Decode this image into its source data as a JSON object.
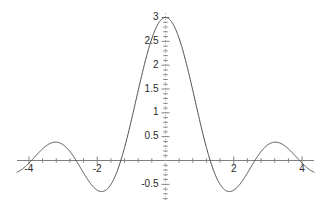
{
  "figure": {
    "type": "function-plot",
    "background_color": "#ffffff",
    "curve_color": "#4a4a4a",
    "axis_color": "#808080",
    "tick_color": "#808080",
    "label_color": "#2a2a2a",
    "width": 322,
    "height": 208
  },
  "axes": {
    "x_axis_name": "horizontal-axis",
    "y_axis_name": "vertical-axis",
    "x_axis_style": "solid",
    "y_axis_style": "dotted",
    "x_tick_labels": [
      "-4",
      "-2",
      "2",
      "4"
    ],
    "x_tick_values": [
      -4,
      -2,
      2,
      4
    ],
    "y_tick_labels": [
      "3",
      "2.5",
      "2",
      "1.5",
      "1",
      "0.5",
      "-0.5"
    ],
    "y_tick_values": [
      3,
      2.5,
      2,
      1.5,
      1,
      0.5,
      -0.5
    ],
    "minor_tick_step_x": 0.4,
    "minor_tick_step_y": 0.1,
    "xlim": [
      -4.35,
      4.35
    ],
    "ylim": [
      -0.85,
      3.15
    ],
    "grid": false,
    "title": "",
    "xlabel": "",
    "ylabel": "",
    "legend": "none"
  },
  "chart_data": {
    "type": "line",
    "title": "",
    "xlabel": "",
    "ylabel": "",
    "xlim": [
      -4.35,
      4.35
    ],
    "ylim": [
      -0.85,
      3.15
    ],
    "grid": false,
    "legend_position": "none",
    "xticks": [
      -4,
      -2,
      2,
      4
    ],
    "xticklabels": [
      "-4",
      "-2",
      "2",
      "4"
    ],
    "yticks": [
      3,
      2.5,
      2,
      1.5,
      1,
      0.5,
      -0.5
    ],
    "yticklabels": [
      "3",
      "2.5",
      "2",
      "1.5",
      "1",
      "0.5",
      "-0.5"
    ],
    "series": [
      {
        "name": "curve",
        "color": "#4a4a4a",
        "expression": "3*sin(2.4*x)/(2.4*x)",
        "peak_value": 3,
        "peak_x": 0,
        "zeros": [
          -3.927,
          -2.618,
          -1.309,
          1.309,
          2.618,
          3.927
        ],
        "local_extrema": [
          {
            "x": -3.27,
            "y": -0.27
          },
          {
            "x": -2.03,
            "y": 0.42
          },
          {
            "x": -1.0,
            "y": -0.64
          },
          {
            "x": 0.0,
            "y": 3.0
          },
          {
            "x": 1.0,
            "y": -0.64
          },
          {
            "x": 2.03,
            "y": 0.42
          },
          {
            "x": 3.27,
            "y": -0.27
          }
        ],
        "x": [
          -4.35,
          -4.2,
          -4.05,
          -3.9,
          -3.75,
          -3.6,
          -3.45,
          -3.3,
          -3.15,
          -3.0,
          -2.85,
          -2.7,
          -2.55,
          -2.4,
          -2.25,
          -2.1,
          -1.95,
          -1.8,
          -1.65,
          -1.5,
          -1.35,
          -1.2,
          -1.05,
          -0.9,
          -0.75,
          -0.6,
          -0.45,
          -0.3,
          -0.15,
          0.0,
          0.15,
          0.3,
          0.45,
          0.6,
          0.75,
          0.9,
          1.05,
          1.2,
          1.35,
          1.5,
          1.65,
          1.8,
          1.95,
          2.1,
          2.25,
          2.4,
          2.55,
          2.7,
          2.85,
          3.0,
          3.15,
          3.3,
          3.45,
          3.6,
          3.75,
          3.9,
          4.05,
          4.2,
          4.35
        ],
        "y": [
          -0.2,
          -0.26,
          -0.29,
          -0.28,
          -0.23,
          -0.15,
          -0.05,
          0.06,
          0.16,
          0.25,
          0.32,
          0.37,
          0.41,
          0.42,
          0.4,
          0.34,
          0.24,
          0.1,
          -0.08,
          -0.28,
          -0.5,
          -0.72,
          -0.92,
          -1.06,
          -1.1,
          -0.96,
          -0.58,
          0.12,
          1.17,
          3.0,
          1.17,
          0.12,
          -0.58,
          -0.96,
          -1.1,
          -1.06,
          -0.92,
          -0.72,
          -0.5,
          -0.28,
          -0.08,
          0.1,
          0.24,
          0.34,
          0.4,
          0.42,
          0.41,
          0.37,
          0.32,
          0.25,
          0.16,
          0.06,
          -0.05,
          -0.15,
          -0.23,
          -0.28,
          -0.29,
          -0.26,
          -0.2
        ]
      }
    ]
  }
}
